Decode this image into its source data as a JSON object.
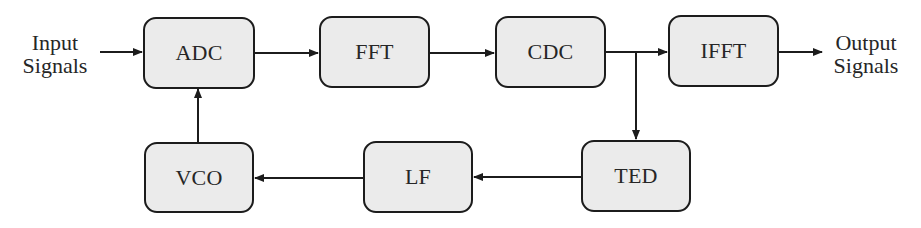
{
  "diagram": {
    "type": "block-diagram",
    "input_label": {
      "line1": "Input",
      "line2": "Signals"
    },
    "output_label": {
      "line1": "Output",
      "line2": "Signals"
    },
    "colors": {
      "block_fill": "#ebebeb",
      "stroke": "#1c1c1c",
      "text": "#262626"
    },
    "blocks": [
      {
        "id": "adc",
        "label": "ADC",
        "row": "top"
      },
      {
        "id": "fft",
        "label": "FFT",
        "row": "top"
      },
      {
        "id": "cdc",
        "label": "CDC",
        "row": "top"
      },
      {
        "id": "ifft",
        "label": "IFFT",
        "row": "top"
      },
      {
        "id": "ted",
        "label": "TED",
        "row": "bottom"
      },
      {
        "id": "lf",
        "label": "LF",
        "row": "bottom"
      },
      {
        "id": "vco",
        "label": "VCO",
        "row": "bottom"
      }
    ],
    "connections": [
      {
        "from": "Input Signals",
        "to": "ADC"
      },
      {
        "from": "ADC",
        "to": "FFT"
      },
      {
        "from": "FFT",
        "to": "CDC"
      },
      {
        "from": "CDC",
        "to": "IFFT"
      },
      {
        "from": "IFFT",
        "to": "Output Signals"
      },
      {
        "from": "CDC",
        "to": "TED",
        "note": "branch from CDC output"
      },
      {
        "from": "TED",
        "to": "LF"
      },
      {
        "from": "LF",
        "to": "VCO"
      },
      {
        "from": "VCO",
        "to": "ADC"
      }
    ]
  }
}
